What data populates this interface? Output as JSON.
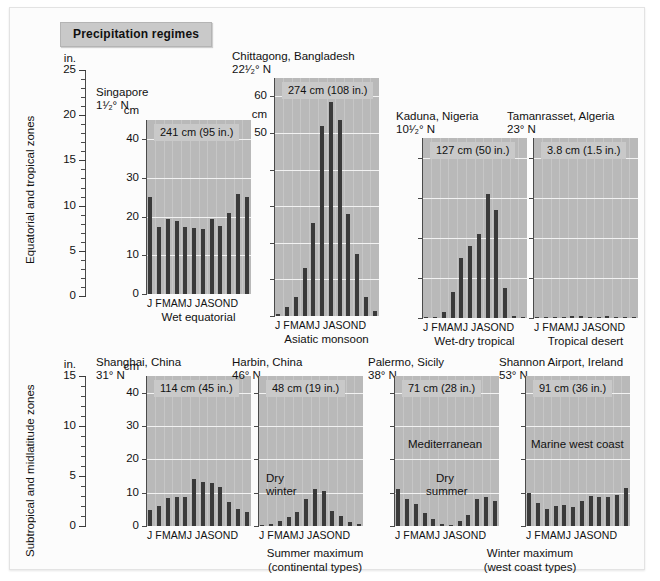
{
  "figure": {
    "title": "Precipitation regimes",
    "row_labels": [
      "Equatorial and tropical zones",
      "Subtropical and midlatitude zones"
    ],
    "inch_axis": {
      "unit": "in.",
      "top_row_labels": [
        "25",
        "20",
        "15",
        "10",
        "5",
        "0"
      ],
      "bottom_row_labels": [
        "15",
        "10",
        "5",
        "0"
      ]
    },
    "group_captions": [
      "Summer maximum\n(continental types)",
      "Winter maximum\n(west coast types)"
    ],
    "group_caption_1_line1": "Summer maximum",
    "group_caption_1_line2": "(continental types)",
    "group_caption_2_line1": "Winter maximum",
    "group_caption_2_line2": "(west coast types)",
    "months": "J FMAMJ JASOND",
    "colors": {
      "bar": "#3a3a3a",
      "plot_background": "#b9b9b9",
      "annotation_background": "#c9c9c9",
      "page_background": "#ffffff",
      "grid": "#f2f2f2"
    }
  },
  "chart_data": [
    {
      "type": "bar",
      "title": "Singapore",
      "latitude": "1¹⁄₂° N",
      "annual_total": "241 cm (95 in.)",
      "regime": "Wet equatorial",
      "xlabel": "",
      "ylabel": "cm",
      "ylim": [
        0,
        45
      ],
      "yticks": [
        0,
        10,
        20,
        30,
        40
      ],
      "ytick_labels": [
        "0",
        "10",
        "20",
        "30",
        "40"
      ],
      "categories": [
        "J",
        "F",
        "M",
        "A",
        "M",
        "J",
        "J",
        "A",
        "S",
        "O",
        "N",
        "D"
      ],
      "values": [
        25.2,
        17.3,
        19.3,
        18.8,
        17.3,
        17.1,
        16.8,
        19.3,
        17.6,
        21.0,
        26.0,
        25.2
      ],
      "grid": true
    },
    {
      "type": "bar",
      "title": "Chittagong, Bangladesh",
      "latitude": "22¹⁄₂° N",
      "annual_total": "274 cm (108 in.)",
      "regime": "Asiatic monsoon",
      "xlabel": "",
      "ylabel": "cm",
      "ylim": [
        0,
        65
      ],
      "yticks": [
        0,
        10,
        20,
        30,
        40,
        50,
        60
      ],
      "ytick_labels": [
        "",
        "",
        "",
        "",
        "",
        "50",
        "60"
      ],
      "categories": [
        "J",
        "F",
        "M",
        "A",
        "M",
        "J",
        "J",
        "A",
        "S",
        "O",
        "N",
        "D"
      ],
      "values": [
        0.6,
        2.4,
        5.1,
        13.0,
        25.4,
        52.0,
        58.5,
        53.5,
        28.0,
        17.0,
        5.3,
        1.3
      ],
      "grid": true
    },
    {
      "type": "bar",
      "title": "Kaduna, Nigeria",
      "latitude": "10¹⁄₂° N",
      "annual_total": "127 cm (50 in.)",
      "regime": "Wet-dry tropical",
      "xlabel": "",
      "ylabel": "",
      "ylim": [
        0,
        45
      ],
      "yticks": [
        0,
        10,
        20,
        30,
        40
      ],
      "ytick_labels": [
        "",
        "",
        "",
        "",
        ""
      ],
      "categories": [
        "J",
        "F",
        "M",
        "A",
        "M",
        "J",
        "J",
        "A",
        "S",
        "O",
        "N",
        "D"
      ],
      "values": [
        0.1,
        0.3,
        1.5,
        6.4,
        15.0,
        18.0,
        21.0,
        31.0,
        27.0,
        7.4,
        0.5,
        0.3
      ],
      "grid": true
    },
    {
      "type": "bar",
      "title": "Tamanrasset, Algeria",
      "latitude": "23° N",
      "annual_total": "3.8 cm (1.5 in.)",
      "regime": "Tropical desert",
      "xlabel": "",
      "ylabel": "",
      "ylim": [
        0,
        45
      ],
      "yticks": [
        0,
        10,
        20,
        30,
        40
      ],
      "ytick_labels": [
        "",
        "",
        "",
        "",
        ""
      ],
      "categories": [
        "J",
        "F",
        "M",
        "A",
        "M",
        "J",
        "J",
        "A",
        "S",
        "O",
        "N",
        "D"
      ],
      "values": [
        0.3,
        0.3,
        0.3,
        0.2,
        0.6,
        0.5,
        0.1,
        0.2,
        0.6,
        0.3,
        0.3,
        0.3
      ],
      "grid": true
    },
    {
      "type": "bar",
      "title": "Shanghai, China",
      "latitude": "31° N",
      "annual_total": "114 cm (45 in.)",
      "regime": "",
      "xlabel": "",
      "ylabel": "cm",
      "ylim": [
        0,
        45
      ],
      "yticks": [
        0,
        10,
        20,
        30,
        40
      ],
      "ytick_labels": [
        "0",
        "10",
        "20",
        "30",
        "40"
      ],
      "categories": [
        "J",
        "F",
        "M",
        "A",
        "M",
        "J",
        "J",
        "A",
        "S",
        "O",
        "N",
        "D"
      ],
      "values": [
        4.8,
        6.0,
        8.5,
        8.6,
        8.6,
        14.2,
        13.3,
        13.0,
        11.8,
        7.2,
        5.1,
        4.2
      ],
      "grid": true
    },
    {
      "type": "bar",
      "title": "Harbin, China",
      "latitude": "46° N",
      "annual_total": "48 cm (19 in.)",
      "regime": "Dry\nwinter",
      "regime_line1": "Dry",
      "regime_line2": "winter",
      "xlabel": "",
      "ylabel": "",
      "ylim": [
        0,
        45
      ],
      "yticks": [
        0,
        10,
        20,
        30,
        40
      ],
      "ytick_labels": [
        "",
        "",
        "",
        "",
        ""
      ],
      "categories": [
        "J",
        "F",
        "M",
        "A",
        "M",
        "J",
        "J",
        "A",
        "S",
        "O",
        "N",
        "D"
      ],
      "values": [
        0.4,
        0.6,
        1.6,
        2.6,
        4.2,
        8.2,
        11.2,
        10.4,
        4.6,
        3.0,
        1.2,
        0.5
      ],
      "grid": true
    },
    {
      "type": "bar",
      "title": "Palermo, Sicily",
      "latitude": "38° N",
      "annual_total": "71 cm (28 in.)",
      "regime": "Mediterranean",
      "note_line1": "Dry",
      "note_line2": "summer",
      "xlabel": "",
      "ylabel": "",
      "ylim": [
        0,
        45
      ],
      "yticks": [
        0,
        10,
        20,
        30,
        40
      ],
      "ytick_labels": [
        "",
        "",
        "",
        "",
        ""
      ],
      "categories": [
        "J",
        "F",
        "M",
        "A",
        "M",
        "J",
        "J",
        "A",
        "S",
        "O",
        "N",
        "D"
      ],
      "values": [
        11.0,
        8.0,
        6.5,
        4.0,
        2.0,
        0.6,
        0.4,
        1.5,
        3.2,
        8.2,
        8.6,
        7.6
      ],
      "grid": true
    },
    {
      "type": "bar",
      "title": "Shannon Airport, Ireland",
      "latitude": "53° N",
      "annual_total": "91 cm (36 in.)",
      "regime": "Marine west coast",
      "xlabel": "",
      "ylabel": "",
      "ylim": [
        0,
        45
      ],
      "yticks": [
        0,
        10,
        20,
        30,
        40
      ],
      "ytick_labels": [
        "",
        "",
        "",
        "",
        ""
      ],
      "categories": [
        "J",
        "F",
        "M",
        "A",
        "M",
        "J",
        "J",
        "A",
        "S",
        "O",
        "N",
        "D"
      ],
      "values": [
        10.0,
        7.0,
        5.0,
        6.0,
        6.4,
        5.6,
        7.4,
        9.0,
        8.6,
        8.6,
        9.4,
        11.4
      ],
      "grid": true
    }
  ]
}
